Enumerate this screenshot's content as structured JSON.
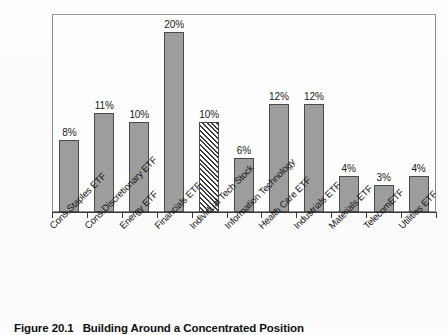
{
  "figure": {
    "caption_number": "Figure 20.1",
    "caption_title": "Building Around a Concentrated Position"
  },
  "chart_data": {
    "type": "bar",
    "title": "Building Around a Concentrated Position",
    "xlabel": "",
    "ylabel": "",
    "ylim": [
      0,
      22
    ],
    "grid": false,
    "legend": "none",
    "categories": [
      "Cons.Staples ETF",
      "Cons.Discretionary ETF",
      "Energy ETF",
      "Financials ETF",
      "Individual Tech Stock",
      "Information Technology",
      "Health Care ETF",
      "Industrials ETF",
      "Materials ETF",
      "TelecomETF",
      "Utilities ETF"
    ],
    "values": [
      8,
      11,
      10,
      20,
      10,
      6,
      12,
      12,
      4,
      3,
      4
    ],
    "value_labels": [
      "8%",
      "11%",
      "10%",
      "20%",
      "10%",
      "6%",
      "12%",
      "12%",
      "4%",
      "3%",
      "4%"
    ],
    "bar_styles": [
      "solid",
      "solid",
      "solid",
      "solid",
      "hatched",
      "solid",
      "solid",
      "solid",
      "solid",
      "solid",
      "solid"
    ],
    "colors": {
      "bar_fill": "#9d9d9d",
      "bar_edge": "#4a4a4a",
      "hatch_line": "#3c3c3c",
      "axis": "#3a3a3a",
      "frame": "#8a8a8a",
      "text": "#151515",
      "background": "#fdfdfd"
    }
  }
}
